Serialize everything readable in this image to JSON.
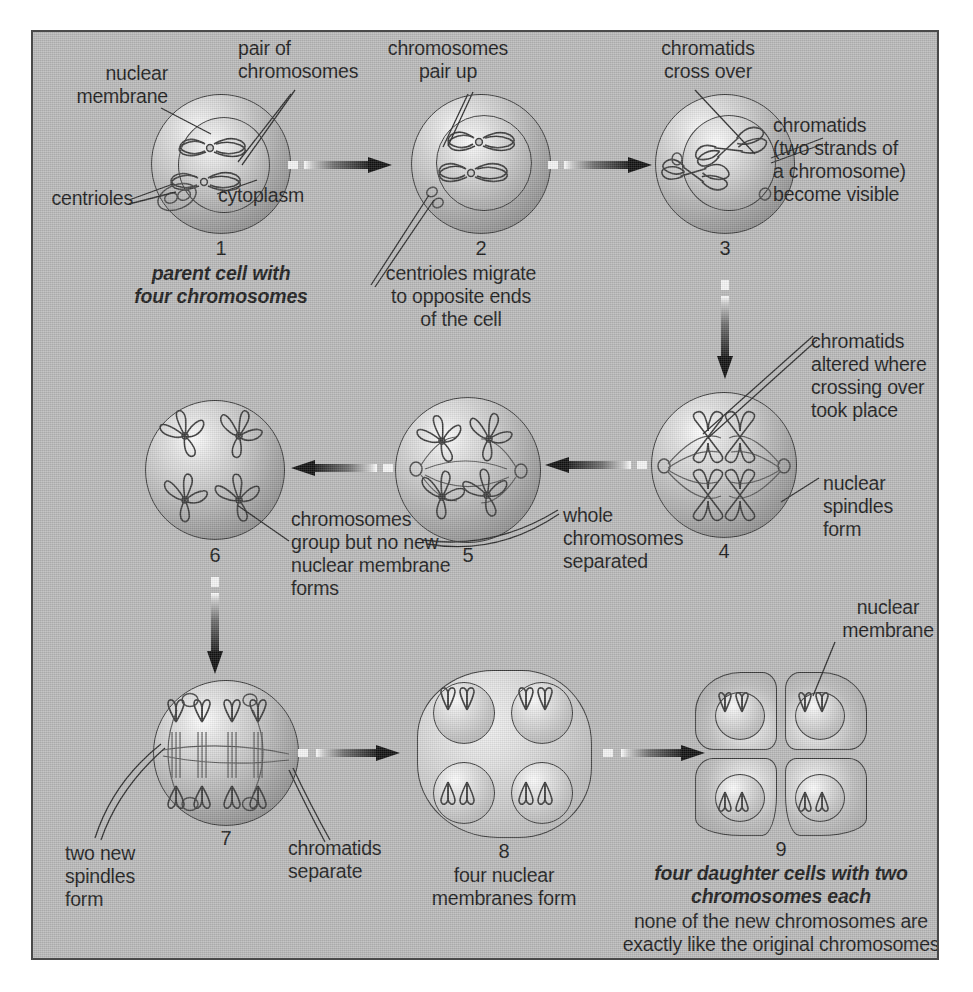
{
  "figure": {
    "background_color": "#b9b9b9",
    "border_color": "#4a4a4a",
    "ink_color": "#1c1c1c"
  },
  "stages": [
    {
      "number": "1",
      "caption": "parent cell with\nfour chromosomes"
    },
    {
      "number": "2",
      "caption": "centrioles migrate\nto opposite ends\nof the cell"
    },
    {
      "number": "3",
      "caption": ""
    },
    {
      "number": "4",
      "caption": ""
    },
    {
      "number": "5",
      "caption": ""
    },
    {
      "number": "6",
      "caption": ""
    },
    {
      "number": "7",
      "caption": ""
    },
    {
      "number": "8",
      "caption": "four nuclear\nmembranes form"
    },
    {
      "number": "9",
      "caption": "four daughter cells with two\nchromosomes each",
      "caption2": "none of the new chromosomes are\nexactly like the original chromosomes"
    }
  ],
  "labels": {
    "nuclear_membrane_1": "nuclear\nmembrane",
    "pair_of_chromosomes": "pair of\nchromosomes",
    "centrioles": "centrioles",
    "cytoplasm": "cytoplasm",
    "chromosomes_pair_up": "chromosomes\npair up",
    "chromatids_cross_over": "chromatids\ncross over",
    "chromatids_two_strands": "chromatids\n(two strands of\na chromosome)\nbecome visible",
    "chromatids_altered": "chromatids\naltered where\ncrossing over\ntook place",
    "nuclear_spindles_form": "nuclear\nspindles\nform",
    "whole_chromosomes_separated": "whole\nchromosomes\nseparated",
    "chromosomes_group": "chromosomes\ngroup but no new\nnuclear membrane\nforms",
    "two_new_spindles_form": "two new\nspindles\nform",
    "chromatids_separate": "chromatids\nseparate",
    "nuclear_membrane_9": "nuclear\nmembrane"
  },
  "arrows": [
    {
      "name": "arrow-1-to-2",
      "direction": "right"
    },
    {
      "name": "arrow-2-to-3",
      "direction": "right"
    },
    {
      "name": "arrow-3-to-4",
      "direction": "down"
    },
    {
      "name": "arrow-4-to-5",
      "direction": "left"
    },
    {
      "name": "arrow-5-to-6",
      "direction": "left"
    },
    {
      "name": "arrow-6-to-7",
      "direction": "down"
    },
    {
      "name": "arrow-7-to-8",
      "direction": "right"
    },
    {
      "name": "arrow-8-to-9",
      "direction": "right"
    }
  ]
}
